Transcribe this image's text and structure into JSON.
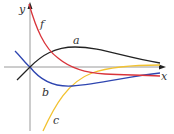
{
  "diagram": {
    "axes": {
      "x_label": "x",
      "y_label": "y",
      "axis_color": "#888888"
    },
    "curves": [
      {
        "name": "f",
        "label": "f",
        "color": "#d9343b"
      },
      {
        "name": "a",
        "label": "a",
        "color": "#222222"
      },
      {
        "name": "b",
        "label": "b",
        "color": "#2e45b0"
      },
      {
        "name": "c",
        "label": "c",
        "color": "#f2c230"
      }
    ]
  }
}
